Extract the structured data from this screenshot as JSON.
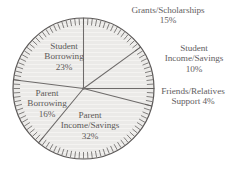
{
  "title_fragment": "",
  "chart_data": {
    "type": "pie",
    "title": "",
    "subtitle": "",
    "xlabel": "",
    "ylabel": "",
    "legend_position": "none",
    "grid": false,
    "units": "percent",
    "start_angle_deg": 0,
    "direction": "clockwise",
    "rim_ticks": 100,
    "categories": [
      "Grants/Scholarships",
      "Student Income/Savings",
      "Friends/Relatives Support",
      "Parent Income/Savings",
      "Parent Borrowing",
      "Student Borrowing"
    ],
    "values": [
      15,
      10,
      4,
      32,
      16,
      23
    ],
    "slices": [
      {
        "label": "Grants/Scholarships",
        "value": 15,
        "value_text": "15%",
        "label_line1": "Grants/Scholarships",
        "label_line2": "15%",
        "placement": "outside-top"
      },
      {
        "label": "Student Income/Savings",
        "value": 10,
        "value_text": "10%",
        "label_line1": "Student",
        "label_line2": "Income/Savings",
        "label_line3": "10%",
        "placement": "outside-right"
      },
      {
        "label": "Friends/Relatives Support",
        "value": 4,
        "value_text": "4%",
        "label_line1": "Friends/Relatives",
        "label_line2": "Support 4%",
        "placement": "outside-right"
      },
      {
        "label": "Parent Income/Savings",
        "value": 32,
        "value_text": "32%",
        "label_line1": "Parent",
        "label_line2": "Income/Savings",
        "label_line3": "32%",
        "placement": "inside"
      },
      {
        "label": "Parent Borrowing",
        "value": 16,
        "value_text": "16%",
        "label_line1": "Parent",
        "label_line2": "Borrowing",
        "label_line3": "16%",
        "placement": "inside"
      },
      {
        "label": "Student Borrowing",
        "value": 23,
        "value_text": "23%",
        "label_line1": "Student",
        "label_line2": "Borrowing",
        "label_line3": "23%",
        "placement": "inside"
      }
    ],
    "colors": {
      "slice_fill": "#ebeae8",
      "slice_stroke": "#6e6b6a",
      "rim_stroke": "#5c5958",
      "text": "#63605f",
      "background": "#ffffff"
    }
  }
}
